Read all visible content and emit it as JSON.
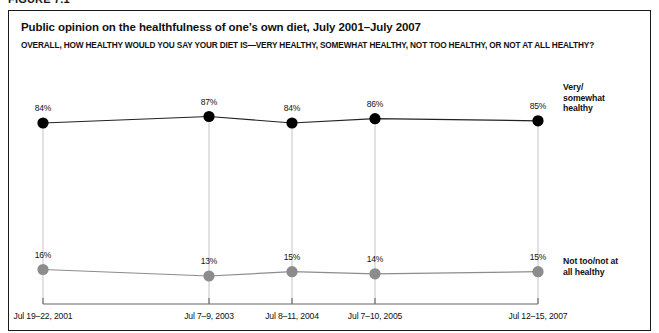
{
  "figure": {
    "number": "FIGURE 7.1"
  },
  "chart_data": {
    "type": "line",
    "title": "Public opinion on the healthfulness of one’s own diet, July 2001–July 2007",
    "subtitle": "OVERALL, HOW HEALTHY WOULD YOU SAY YOUR DIET IS—VERY HEALTHY, SOMEWHAT HEALTHY, NOT TOO HEALTHY, OR NOT AT ALL HEALTHY?",
    "xlabel": "",
    "ylabel": "",
    "ylim": [
      0,
      100
    ],
    "grid": "vertical-droplines",
    "legend_position": "right-inline",
    "categories": [
      "Jul 19–22, 2001",
      "Jul 7–9, 2003",
      "Jul 8–11, 2004",
      "Jul 7–10, 2005",
      "Jul 12–15, 2007"
    ],
    "series": [
      {
        "name": "Very/somewhat healthy",
        "color": "#000000",
        "values": [
          84,
          87,
          84,
          86,
          85
        ],
        "labels": [
          "84%",
          "87%",
          "84%",
          "86%",
          "85%"
        ]
      },
      {
        "name": "Not too/not at all healthy",
        "color": "#8c8c8c",
        "values": [
          16,
          13,
          15,
          14,
          15
        ],
        "labels": [
          "16%",
          "13%",
          "15%",
          "14%",
          "15%"
        ]
      }
    ],
    "axis_color": "#666666",
    "gridline_color": "#b5b5b5",
    "frame_color": "#1a1a1a"
  }
}
